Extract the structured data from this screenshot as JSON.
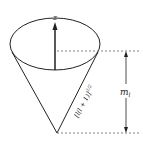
{
  "diagram": {
    "axis_label": "z",
    "side_label": "[l(l + 1)]",
    "side_exponent": "1/2",
    "projection_label": "m",
    "projection_subscript": "l",
    "colors": {
      "line": "#222222",
      "dash": "#666666",
      "background": "#ffffff"
    }
  }
}
